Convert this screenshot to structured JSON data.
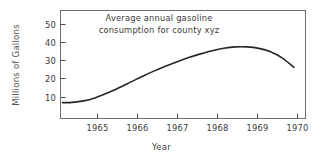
{
  "chart_data": {
    "type": "line",
    "title": "Average annual gasoline consumption for county xyz",
    "title_lines": [
      "Average annual gasoline",
      "consumption for county xyz"
    ],
    "xlabel": "Year",
    "ylabel": "Millions of Gallons",
    "grid": false,
    "legend": "none",
    "xlim": [
      1964.3,
      1970.6
    ],
    "ylim": [
      0,
      57
    ],
    "xticks": [
      1965,
      1966,
      1967,
      1968,
      1969,
      1970
    ],
    "xtick_labels": [
      "1965",
      "1966",
      "1967",
      "1968",
      "1969",
      "1970"
    ],
    "yticks": [
      10,
      20,
      30,
      40,
      50
    ],
    "ytick_labels": [
      "10",
      "20",
      "30",
      "40",
      "50"
    ],
    "series": [
      {
        "name": "Average annual gasoline consumption",
        "x": [
          1964.35,
          1964.6,
          1964.9,
          1965.2,
          1965.5,
          1965.8,
          1966.1,
          1966.4,
          1966.7,
          1967.0,
          1967.3,
          1967.6,
          1967.9,
          1968.2,
          1968.5,
          1968.8,
          1969.1,
          1969.4,
          1969.7,
          1970.0,
          1970.3
        ],
        "y": [
          8.4,
          8.5,
          9.3,
          11.0,
          13.4,
          16.2,
          19.2,
          22.2,
          25.0,
          27.6,
          30.0,
          32.2,
          34.1,
          35.8,
          37.1,
          37.8,
          37.8,
          37.0,
          35.2,
          32.0,
          27.0
        ]
      }
    ],
    "colors": {
      "line": "#262626",
      "frame": "#6e6e6e",
      "text": "#3a3a3a",
      "axis_title": "#555555",
      "background": "#ffffff"
    }
  }
}
